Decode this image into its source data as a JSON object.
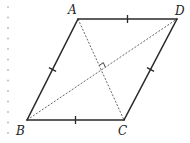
{
  "figure": {
    "type": "rhombus",
    "vertices": [
      {
        "name": "A",
        "label": "A"
      },
      {
        "name": "D",
        "label": "D"
      },
      {
        "name": "C",
        "label": "C"
      },
      {
        "name": "B",
        "label": "B"
      }
    ],
    "sides": [
      {
        "from": "A",
        "to": "D",
        "tick_marks": 1
      },
      {
        "from": "D",
        "to": "C",
        "tick_marks": 1
      },
      {
        "from": "C",
        "to": "B",
        "tick_marks": 1
      },
      {
        "from": "B",
        "to": "A",
        "tick_marks": 1
      }
    ],
    "diagonals": [
      {
        "from": "A",
        "to": "C",
        "style": "dashed"
      },
      {
        "from": "B",
        "to": "D",
        "style": "dashed"
      }
    ],
    "right_angle_at": "diagonal-intersection",
    "colors": {
      "line": "#2a2a2a",
      "diagonal": "#555555",
      "background": "#ffffff",
      "margin_dots": "#bdbdbd"
    }
  }
}
